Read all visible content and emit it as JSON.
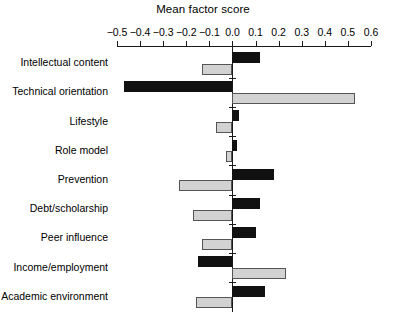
{
  "chart_data": {
    "type": "bar",
    "title": "Mean factor score",
    "xlabel": "Mean factor score",
    "ylabel": "",
    "orientation": "horizontal",
    "xlim": [
      -0.5,
      0.6
    ],
    "grid": false,
    "legend": "none",
    "xticks": [
      -0.5,
      -0.4,
      -0.3,
      -0.2,
      -0.1,
      0.0,
      0.1,
      0.2,
      0.3,
      0.4,
      0.5,
      0.6
    ],
    "xticklabels": [
      "−0.5",
      "−0.4",
      "−0.3",
      "−0.2",
      "−0.1",
      "0.0",
      "0.1",
      "0.2",
      "0.3",
      "0.4",
      "0.5",
      "0.6"
    ],
    "categories": [
      "Intellectual content",
      "Technical orientation",
      "Lifestyle",
      "Role model",
      "Prevention",
      "Debt/scholarship",
      "Peer influence",
      "Income/employment",
      "Academic environment"
    ],
    "series": [
      {
        "name": "series-dark",
        "color": "#111111",
        "values": [
          0.12,
          -0.47,
          0.03,
          0.02,
          0.18,
          0.12,
          0.1,
          -0.15,
          0.14
        ]
      },
      {
        "name": "series-light",
        "color": "#d2d2d2",
        "values": [
          -0.13,
          0.53,
          -0.07,
          -0.03,
          -0.23,
          -0.17,
          -0.13,
          0.23,
          -0.16
        ]
      }
    ]
  },
  "caption": {
    "text": ""
  }
}
